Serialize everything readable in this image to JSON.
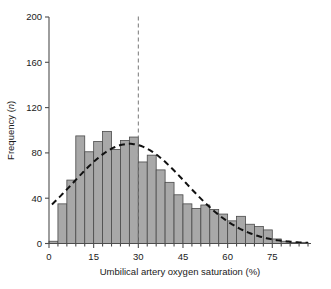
{
  "chart_data": {
    "type": "bar",
    "title": "",
    "xlabel": "Umbilical artery oxygen saturation (%)",
    "ylabel": "Frequency (n)",
    "ylabel_plain": "Frequency (",
    "ylabel_italic": "n",
    "ylabel_close": ")",
    "xlim": [
      0,
      88
    ],
    "ylim": [
      0,
      200
    ],
    "xticks": [
      0,
      15,
      30,
      45,
      60,
      75
    ],
    "yticks": [
      0,
      40,
      80,
      120,
      160,
      200
    ],
    "xtick_labels": [
      "0",
      "15",
      "30",
      "45",
      "60",
      "75"
    ],
    "ytick_labels": [
      "0",
      "40",
      "80",
      "120",
      "160",
      "200"
    ],
    "grid": false,
    "legend": null,
    "bin_width": 3,
    "bin_starts": [
      0,
      3,
      6,
      9,
      12,
      15,
      18,
      21,
      24,
      27,
      30,
      33,
      36,
      39,
      42,
      45,
      48,
      51,
      54,
      57,
      60,
      63,
      66,
      69,
      72,
      75,
      78,
      81,
      84
    ],
    "values": [
      2,
      35,
      56,
      95,
      81,
      90,
      99,
      83,
      91,
      94,
      72,
      78,
      65,
      54,
      43,
      35,
      31,
      34,
      30,
      26,
      20,
      24,
      17,
      15,
      12,
      4,
      2,
      1,
      1
    ],
    "bars_label": "Frequency of umbilical artery oxygen saturation",
    "overlay_curve": {
      "style": "dashed",
      "label": "Fitted normal distribution curve",
      "peak_x": 27,
      "peak_y": 88,
      "mean": 27,
      "sd": 19,
      "amplitude": 88,
      "x_start": 1,
      "x_end": 87
    },
    "reference_line": {
      "style": "dashed",
      "orientation": "vertical",
      "x": 30,
      "label": "Reference line at 30%"
    },
    "bar_fill": "#a8a8a8",
    "bar_stroke": "#4a4a4a",
    "curve_color": "#111111",
    "axis_color": "#4d4d4d"
  }
}
